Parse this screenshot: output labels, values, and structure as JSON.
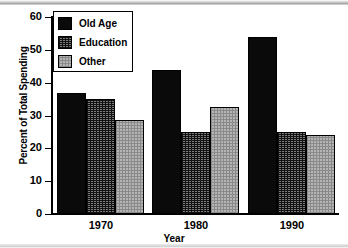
{
  "chart_data": {
    "type": "bar",
    "title": "",
    "xlabel": "Year",
    "ylabel": "Percent of Total Spending",
    "categories": [
      "1970",
      "1980",
      "1990"
    ],
    "series": [
      {
        "name": "Old Age",
        "values": [
          37,
          44,
          54
        ],
        "fill": "solid-black",
        "color": "#0a0a0a"
      },
      {
        "name": "Education",
        "values": [
          35,
          25,
          25
        ],
        "fill": "crosshatch",
        "color": "#7d7d7d"
      },
      {
        "name": "Other",
        "values": [
          28.5,
          32.5,
          24
        ],
        "fill": "dots",
        "color": "#b4b4b4"
      }
    ],
    "ylim": [
      0,
      60
    ],
    "yticks": [
      0,
      10,
      20,
      30,
      40,
      50,
      60
    ],
    "ytick_labels": [
      "0",
      "10",
      "20",
      "30",
      "40",
      "50",
      "60"
    ],
    "grid": false,
    "legend_position": "top-left",
    "legend_entries": [
      "Old Age",
      "Education",
      "Other"
    ]
  },
  "axes": {
    "y_title": "Percent of Total Spending",
    "x_title": "Year"
  }
}
